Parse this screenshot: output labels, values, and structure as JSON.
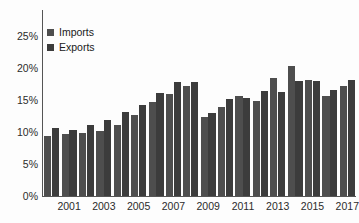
{
  "chart_data": {
    "type": "bar",
    "title": "",
    "subtitle": "",
    "xlabel": "",
    "ylabel": "",
    "ylim": [
      0,
      25
    ],
    "ytick_labels": [
      "0%",
      "5%",
      "10%",
      "15%",
      "20%",
      "25%"
    ],
    "ytick_values": [
      0,
      5,
      10,
      15,
      20,
      25
    ],
    "grid": false,
    "legend_position": "top-left",
    "value_suffix": "%",
    "categories": [
      "2000",
      "2001",
      "2002",
      "2003",
      "2004",
      "2005",
      "2006",
      "2007",
      "2008",
      "2009",
      "2010",
      "2011",
      "2012",
      "2013",
      "2014",
      "2015",
      "2016",
      "2017"
    ],
    "xtick_labels": [
      "2001",
      "2003",
      "2005",
      "2007",
      "2009",
      "2011",
      "2013",
      "2015",
      "2017"
    ],
    "series": [
      {
        "name": "Imports",
        "color": "#4e4e4e",
        "values": [
          9.4,
          9.7,
          9.9,
          10.1,
          11.1,
          12.7,
          14.7,
          15.9,
          17.2,
          12.3,
          13.9,
          15.7,
          14.9,
          18.5,
          20.3,
          18.2,
          15.6,
          17.2
        ]
      },
      {
        "name": "Exports",
        "color": "#3c3c3c",
        "values": [
          10.7,
          10.3,
          11.1,
          11.8,
          13.2,
          14.2,
          16.1,
          17.8,
          17.8,
          12.9,
          15.2,
          15.3,
          16.4,
          16.2,
          18.0,
          18.0,
          16.6,
          18.1
        ]
      }
    ]
  }
}
